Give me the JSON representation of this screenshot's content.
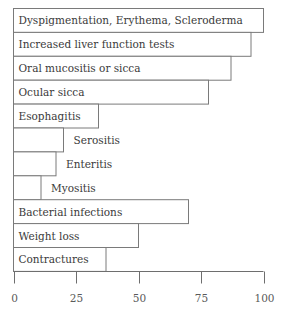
{
  "chart_data": {
    "type": "bar",
    "orientation": "horizontal",
    "title": "",
    "xlabel": "",
    "ylabel": "",
    "xlim": [
      0,
      100
    ],
    "xticks": [
      0,
      25,
      50,
      75,
      100
    ],
    "tick_labels": [
      "0",
      "25",
      "50",
      "75",
      "100"
    ],
    "grid": false,
    "legend": null,
    "label_placement": "inside bar when fits, otherwise right of bar",
    "categories": [
      "Dyspigmentation, Erythema, Scleroderma",
      "Increased liver function tests",
      "Oral mucositis or sicca",
      "Ocular sicca",
      "Esophagitis",
      "Serositis",
      "Enteritis",
      "Myositis",
      "Bacterial infections",
      "Weight loss",
      "Contractures"
    ],
    "values": [
      100,
      95,
      87,
      78,
      34,
      20,
      17,
      11,
      70,
      50,
      37
    ]
  }
}
